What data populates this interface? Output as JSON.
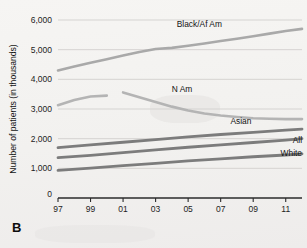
{
  "panel": {
    "label": "B"
  },
  "chart_data": {
    "type": "line",
    "title": "",
    "xlabel": "",
    "ylabel": "Number of patients (in thousands)",
    "xlim": [
      1997,
      2012
    ],
    "ylim": [
      0,
      6000
    ],
    "grid": true,
    "legend_position": "inline-right",
    "x_tick_labels": [
      "97",
      "99",
      "01",
      "03",
      "05",
      "07",
      "09",
      "11"
    ],
    "x_tick_values": [
      1997,
      1999,
      2001,
      2003,
      2005,
      2007,
      2009,
      2011
    ],
    "y_tick_labels": [
      "0",
      "1,000",
      "2,000",
      "3,000",
      "4,000",
      "5,000",
      "6,000"
    ],
    "y_tick_values": [
      0,
      1000,
      2000,
      3000,
      4000,
      5000,
      6000
    ],
    "origin_label": "0",
    "series": [
      {
        "name": "Black/Af Am",
        "label": "Black/Af Am",
        "color": "#a9a9a9",
        "width": 2.6,
        "x": [
          1997,
          1998,
          1999,
          2000,
          2001,
          2002,
          2003,
          2004,
          2005,
          2006,
          2007,
          2008,
          2009,
          2010,
          2011,
          2012
        ],
        "values": [
          4300,
          4430,
          4560,
          4680,
          4800,
          4920,
          5020,
          5060,
          5130,
          5210,
          5290,
          5370,
          5450,
          5540,
          5630,
          5700
        ]
      },
      {
        "name": "N Am segment 1",
        "label": "",
        "color": "#b4b4b4",
        "width": 2.6,
        "x": [
          1997,
          1998,
          1999,
          2000
        ],
        "values": [
          3130,
          3300,
          3420,
          3450
        ]
      },
      {
        "name": "N Am",
        "label": "N Am",
        "color": "#b4b4b4",
        "width": 2.6,
        "x": [
          2001,
          2002,
          2003,
          2004,
          2005,
          2006,
          2007,
          2008,
          2009,
          2010,
          2011,
          2012
        ],
        "values": [
          3560,
          3400,
          3240,
          3080,
          2950,
          2850,
          2780,
          2730,
          2690,
          2670,
          2660,
          2660
        ]
      },
      {
        "name": "Asian",
        "label": "Asian",
        "color": "#7c7c7c",
        "width": 2.8,
        "x": [
          1997,
          1999,
          2001,
          2003,
          2005,
          2007,
          2009,
          2011,
          2012
        ],
        "values": [
          1700,
          1790,
          1880,
          1970,
          2060,
          2140,
          2210,
          2290,
          2320
        ]
      },
      {
        "name": "All",
        "label": "All",
        "color": "#7c7c7c",
        "width": 2.8,
        "x": [
          1997,
          1999,
          2001,
          2003,
          2005,
          2007,
          2009,
          2011,
          2012
        ],
        "values": [
          1360,
          1440,
          1530,
          1620,
          1710,
          1790,
          1870,
          1950,
          2000
        ]
      },
      {
        "name": "White",
        "label": "White",
        "color": "#7c7c7c",
        "width": 2.8,
        "x": [
          1997,
          1999,
          2001,
          2003,
          2005,
          2007,
          2009,
          2011,
          2012
        ],
        "values": [
          930,
          1010,
          1090,
          1170,
          1250,
          1320,
          1390,
          1450,
          1490
        ]
      }
    ],
    "annotations": [
      {
        "text": "Black/Af Am",
        "x": 2004.3,
        "y": 5780,
        "anchor": "start"
      },
      {
        "text": "N Am",
        "x": 2004.0,
        "y": 3560,
        "anchor": "start"
      },
      {
        "text": "Asian",
        "x": 2007.6,
        "y": 2480,
        "anchor": "start"
      },
      {
        "text": "All",
        "x": 2012.0,
        "y": 1870,
        "anchor": "end"
      },
      {
        "text": "White",
        "x": 2012.0,
        "y": 1430,
        "anchor": "end"
      }
    ]
  }
}
